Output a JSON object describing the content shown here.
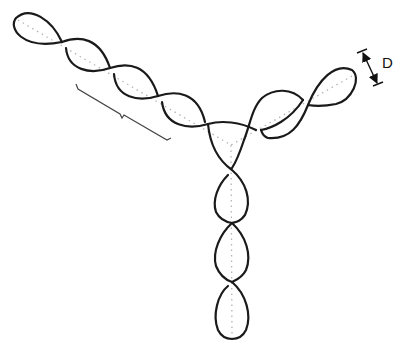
{
  "figure": {
    "header_text": "· · · · · · · · · · · · · · ·",
    "arms": [
      {
        "name": "left-arm",
        "direction": "upper-left"
      },
      {
        "name": "right-arm",
        "direction": "upper-right"
      },
      {
        "name": "bottom-arm",
        "direction": "down"
      }
    ],
    "annotations": {
      "diameter_label": "D",
      "bracket": "helical-turn-length"
    },
    "colors": {
      "strand": "#1a1a1a",
      "axis": "#b5b5b5",
      "background": "#ffffff"
    }
  }
}
